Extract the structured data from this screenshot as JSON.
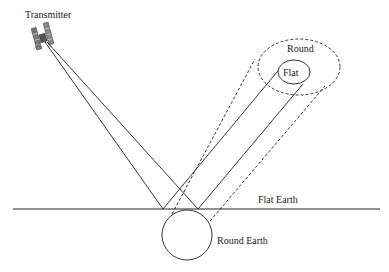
{
  "diagram": {
    "labels": {
      "transmitter": "Transmitter",
      "round_footprint": "Round",
      "flat_footprint": "Flat",
      "flat_earth": "Flat Earth",
      "round_earth": "Round Earth"
    },
    "colors": {
      "line": "#222222",
      "background": "#ffffff"
    },
    "elements": [
      {
        "type": "icon",
        "name": "satellite-transmitter"
      },
      {
        "type": "line",
        "name": "flat-earth-surface",
        "style": "solid"
      },
      {
        "type": "circle",
        "name": "round-earth",
        "style": "solid"
      },
      {
        "type": "ellipse",
        "name": "flat-footprint",
        "style": "solid"
      },
      {
        "type": "ellipse",
        "name": "round-footprint",
        "style": "dashed"
      },
      {
        "type": "rays",
        "name": "incident-rays",
        "style": "solid",
        "count": 2
      },
      {
        "type": "rays",
        "name": "flat-reflected-rays",
        "style": "solid",
        "count": 2
      },
      {
        "type": "rays",
        "name": "round-reflected-rays",
        "style": "dashed",
        "count": 2
      }
    ]
  }
}
